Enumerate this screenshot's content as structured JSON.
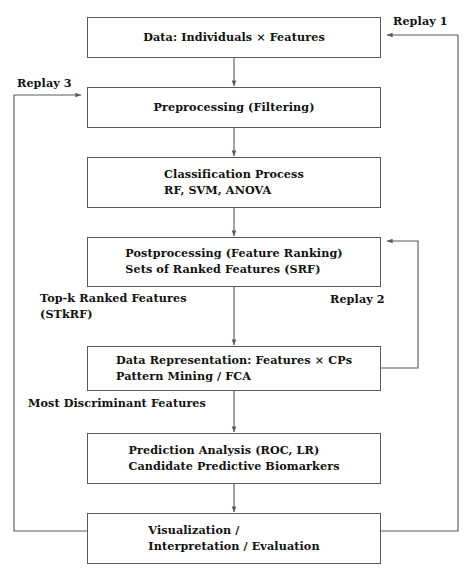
{
  "diagram": {
    "stroke_color": "#5a5a5a",
    "text_color": "#111111",
    "background_color": "#ffffff",
    "nodes": [
      {
        "id": "data",
        "label": "Data: Individuals × Features",
        "align": "center"
      },
      {
        "id": "preprocessing",
        "label": "Preprocessing (Filtering)",
        "align": "center"
      },
      {
        "id": "classification",
        "label": "Classification Process\nRF, SVM, ANOVA",
        "align": "left"
      },
      {
        "id": "postprocessing",
        "label": "Postprocessing (Feature Ranking)\nSets of Ranked Features (SRF)",
        "align": "left"
      },
      {
        "id": "representation",
        "label": "Data Representation: Features × CPs\nPattern Mining / FCA",
        "align": "left"
      },
      {
        "id": "prediction",
        "label": "Prediction Analysis (ROC, LR)\nCandidate Predictive Biomarkers",
        "align": "left"
      },
      {
        "id": "visualization",
        "label": "Visualization /\nInterpretation / Evaluation",
        "align": "left"
      }
    ],
    "edge_labels": [
      {
        "id": "replay-1",
        "label": "Replay 1"
      },
      {
        "id": "replay-3",
        "label": "Replay 3"
      },
      {
        "id": "top-k-ranked",
        "label": "Top-k Ranked Features\n(STkRF)"
      },
      {
        "id": "replay-2",
        "label": "Replay 2"
      },
      {
        "id": "most-discriminant",
        "label": "Most Discriminant Features"
      }
    ]
  }
}
